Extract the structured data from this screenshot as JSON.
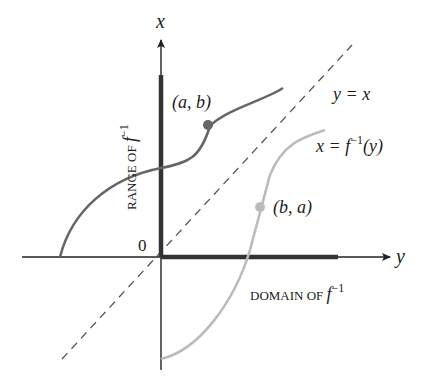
{
  "diagram": {
    "axes": {
      "vertical_label": "x",
      "horizontal_label": "y",
      "origin_label": "0"
    },
    "labels": {
      "line_identity": "y = x",
      "inverse_curve": "x = f",
      "inverse_sup": "−1",
      "inverse_arg": "(y)",
      "point_ab": "(a, b)",
      "point_ba": "(b, a)",
      "range_prefix": "RANGE OF ",
      "range_f": "f",
      "range_sup": "−1",
      "domain_prefix": "DOMAIN OF ",
      "domain_f": "f",
      "domain_sup": "−1"
    },
    "colors": {
      "axis": "#222222",
      "curve_f": "#666666",
      "curve_inverse": "#bbbbbb",
      "point_ab": "#666666",
      "point_ba": "#bbbbbb",
      "dashed_line": "#555555",
      "highlight_bar": "#333333"
    }
  }
}
